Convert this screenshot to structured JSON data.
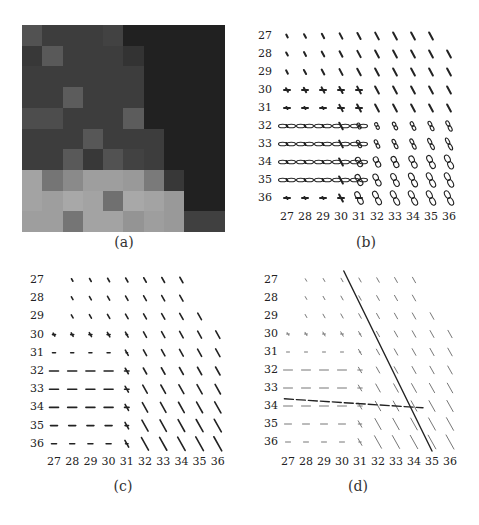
{
  "figure": {
    "panels": [
      {
        "id": "a",
        "caption": "(a)",
        "type": "image"
      },
      {
        "id": "b",
        "caption": "(b)",
        "type": "glyph-field"
      },
      {
        "id": "c",
        "caption": "(c)",
        "type": "orientation-field"
      },
      {
        "id": "d",
        "caption": "(d)",
        "type": "orientation-field-with-lines"
      }
    ],
    "axis_ticks": [
      "27",
      "28",
      "29",
      "30",
      "31",
      "32",
      "33",
      "34",
      "35",
      "36"
    ]
  },
  "panel_a": {
    "caption": "(a)",
    "grid_rows": 10,
    "grid_cols": 10,
    "intensity": [
      [
        0.32,
        0.24,
        0.24,
        0.24,
        0.26,
        0.13,
        0.13,
        0.13,
        0.13,
        0.13
      ],
      [
        0.22,
        0.35,
        0.24,
        0.24,
        0.24,
        0.2,
        0.13,
        0.13,
        0.13,
        0.13
      ],
      [
        0.24,
        0.24,
        0.24,
        0.24,
        0.24,
        0.24,
        0.13,
        0.13,
        0.13,
        0.13
      ],
      [
        0.24,
        0.24,
        0.36,
        0.24,
        0.24,
        0.24,
        0.13,
        0.13,
        0.13,
        0.13
      ],
      [
        0.3,
        0.3,
        0.24,
        0.24,
        0.24,
        0.36,
        0.13,
        0.13,
        0.13,
        0.13
      ],
      [
        0.24,
        0.24,
        0.24,
        0.34,
        0.24,
        0.24,
        0.24,
        0.13,
        0.13,
        0.13
      ],
      [
        0.24,
        0.24,
        0.35,
        0.22,
        0.32,
        0.26,
        0.24,
        0.13,
        0.13,
        0.13
      ],
      [
        0.64,
        0.46,
        0.54,
        0.62,
        0.62,
        0.6,
        0.48,
        0.22,
        0.13,
        0.13
      ],
      [
        0.64,
        0.62,
        0.66,
        0.64,
        0.44,
        0.66,
        0.64,
        0.6,
        0.13,
        0.13
      ],
      [
        0.62,
        0.62,
        0.46,
        0.64,
        0.64,
        0.58,
        0.62,
        0.6,
        0.25,
        0.25
      ]
    ]
  },
  "panel_b": {
    "caption": "(b)",
    "row_labels": [
      "27",
      "28",
      "29",
      "30",
      "31",
      "32",
      "33",
      "34",
      "35",
      "36"
    ],
    "col_labels": [
      "27",
      "28",
      "29",
      "30",
      "31",
      "32",
      "33",
      "34",
      "35",
      "36"
    ]
  },
  "panel_c": {
    "caption": "(c)",
    "row_labels": [
      "27",
      "28",
      "29",
      "30",
      "31",
      "32",
      "33",
      "34",
      "35",
      "36"
    ],
    "col_labels": [
      "27",
      "28",
      "29",
      "30",
      "31",
      "32",
      "33",
      "34",
      "35",
      "36"
    ]
  },
  "panel_d": {
    "caption": "(d)",
    "row_labels": [
      "27",
      "28",
      "29",
      "30",
      "31",
      "32",
      "33",
      "34",
      "35",
      "36"
    ],
    "col_labels": [
      "27",
      "28",
      "29",
      "30",
      "31",
      "32",
      "33",
      "34",
      "35",
      "36"
    ],
    "lines": [
      {
        "style": "solid",
        "from": [
          30.1,
          26.5
        ],
        "to": [
          35.0,
          36.5
        ]
      },
      {
        "style": "dashed",
        "from": [
          26.8,
          33.6
        ],
        "to": [
          34.5,
          34.1
        ]
      }
    ]
  }
}
